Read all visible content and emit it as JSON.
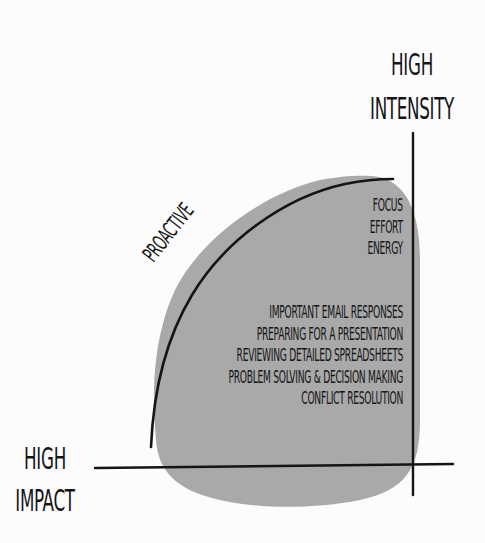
{
  "diagram": {
    "type": "quadrant-sketch",
    "colors": {
      "background": "#fcfcfc",
      "blob_fill": "#a9a9a9",
      "ink": "#151515"
    },
    "axes": {
      "vertical_label": {
        "line1": "HIGH",
        "line2": "INTENSITY"
      },
      "horizontal_label": {
        "line1": "HIGH",
        "line2": "IMPACT"
      }
    },
    "curve_label": "PROACTIVE",
    "traits": [
      "FOCUS",
      "EFFORT",
      "ENERGY"
    ],
    "tasks": [
      "IMPORTANT EMAIL RESPONSES",
      "PREPARING FOR A PRESENTATION",
      "REVIEWING DETAILED SPREADSHEETS",
      "PROBLEM SOLVING & DECISION MAKING",
      "CONFLICT RESOLUTION"
    ]
  }
}
